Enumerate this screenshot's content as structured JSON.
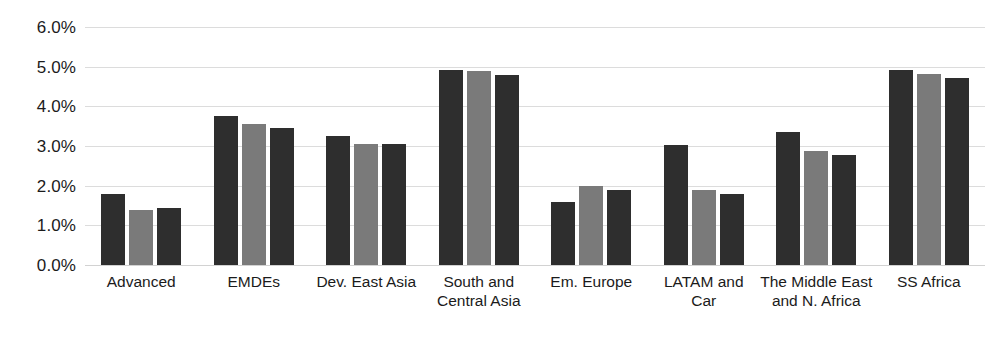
{
  "chart_data": {
    "type": "bar",
    "title": "",
    "subtitle": "",
    "xlabel": "",
    "ylabel": "",
    "ylim": [
      0.0,
      6.0
    ],
    "y_tick_labels": [
      "6.0%",
      "5.0%",
      "4.0%",
      "3.0%",
      "2.0%",
      "1.0%",
      "0.0%"
    ],
    "y_ticks": [
      6.0,
      5.0,
      4.0,
      3.0,
      2.0,
      1.0,
      0.0
    ],
    "grid": true,
    "grid_axis": "y",
    "legend": false,
    "legend_position": "none",
    "categories": [
      "Advanced",
      "EMDEs",
      "Dev. East Asia",
      "South and\nCentral Asia",
      "Em. Europe",
      "LATAM and\nCar",
      "The Middle East\nand N. Africa",
      "SS Africa"
    ],
    "series": [
      {
        "name": "Series 1",
        "color": "#2e2e2e",
        "values": [
          1.78,
          3.75,
          3.25,
          4.92,
          1.6,
          3.02,
          3.35,
          4.92
        ]
      },
      {
        "name": "Series 2",
        "color": "#7a7a7a",
        "values": [
          1.38,
          3.56,
          3.05,
          4.9,
          2.0,
          1.88,
          2.87,
          4.82
        ]
      },
      {
        "name": "Series 3",
        "color": "#2e2e2e",
        "values": [
          1.44,
          3.45,
          3.06,
          4.8,
          1.9,
          1.78,
          2.78,
          4.72
        ]
      }
    ],
    "units": "percent",
    "value_suffix": "%"
  },
  "footnote": {
    "text": ""
  },
  "colors": {
    "series_dark": "#2e2e2e",
    "series_gray": "#7a7a7a",
    "gridline": "#dcdcdc",
    "text": "#1b1b1b",
    "background": "#ffffff"
  }
}
